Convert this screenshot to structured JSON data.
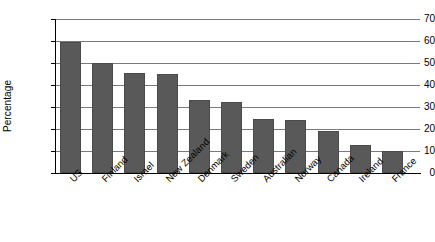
{
  "chart_data": {
    "type": "bar",
    "title": "",
    "xlabel": "",
    "ylabel": "Percentage",
    "ylim": [
      0,
      70
    ],
    "yticks": [
      0,
      10,
      20,
      30,
      40,
      50,
      60,
      70
    ],
    "ytick_labels": [
      "0",
      "10",
      "20",
      "30",
      "40",
      "50",
      "60",
      "70"
    ],
    "grid": true,
    "legend": false,
    "bar_color": "#595959",
    "gridline_color": "#7a7a7a",
    "axis_color": "#000000",
    "categories": [
      "US",
      "Finland",
      "Israel",
      "New Zealand",
      "Denmark",
      "Sweden",
      "Australian",
      "Norway",
      "Canada",
      "Ireland",
      "France"
    ],
    "values": [
      59.5,
      50,
      45.5,
      45,
      33,
      32.5,
      24.7,
      24.2,
      19,
      12.8,
      10
    ]
  }
}
